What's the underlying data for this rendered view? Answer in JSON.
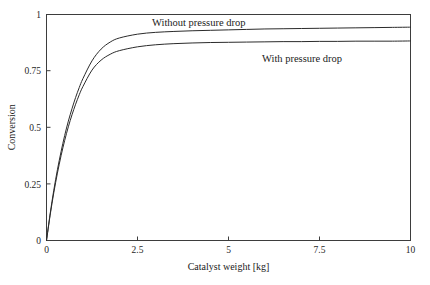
{
  "chart_data": {
    "type": "line",
    "title": "",
    "xlabel": "Catalyst weight [kg]",
    "ylabel": "Conversion",
    "xlim": [
      0,
      10
    ],
    "ylim": [
      0,
      1
    ],
    "xticks": [
      0,
      2.5,
      5,
      7.5,
      10
    ],
    "xtick_labels": [
      "0",
      "2.5",
      "5",
      "7.5",
      "10"
    ],
    "yticks": [
      0,
      0.25,
      0.5,
      0.75,
      1
    ],
    "ytick_labels": [
      "0",
      "0.25",
      "0.5",
      "0.75",
      "1"
    ],
    "grid": false,
    "legend": "inline-annotations",
    "x": [
      0,
      0.1,
      0.2,
      0.3,
      0.4,
      0.5,
      0.6,
      0.7,
      0.8,
      0.9,
      1.0,
      1.25,
      1.5,
      1.75,
      2.0,
      2.5,
      3.0,
      3.5,
      4.0,
      4.5,
      5.0,
      5.5,
      6.0,
      6.5,
      7.0,
      7.5,
      8.0,
      8.5,
      9.0,
      9.5,
      10.0
    ],
    "series": [
      {
        "name": "Without pressure drop",
        "values": [
          0,
          0.118,
          0.222,
          0.313,
          0.393,
          0.465,
          0.528,
          0.583,
          0.633,
          0.677,
          0.716,
          0.795,
          0.847,
          0.878,
          0.896,
          0.913,
          0.921,
          0.925,
          0.928,
          0.93,
          0.932,
          0.934,
          0.936,
          0.937,
          0.938,
          0.939,
          0.94,
          0.941,
          0.942,
          0.943,
          0.944
        ],
        "annotation": "Without pressure drop",
        "annotation_x": 3.6,
        "annotation_y": 0.945
      },
      {
        "name": "With pressure drop",
        "values": [
          0,
          0.112,
          0.211,
          0.298,
          0.375,
          0.443,
          0.503,
          0.556,
          0.603,
          0.645,
          0.681,
          0.754,
          0.798,
          0.824,
          0.84,
          0.857,
          0.866,
          0.871,
          0.874,
          0.876,
          0.877,
          0.878,
          0.879,
          0.88,
          0.88,
          0.881,
          0.881,
          0.882,
          0.882,
          0.882,
          0.883
        ],
        "annotation": "With pressure drop",
        "annotation_x": 6.8,
        "annotation_y": 0.81
      }
    ]
  },
  "axes": {
    "x_title": "Catalyst weight [kg]",
    "y_title": "Conversion"
  },
  "colors": {
    "line": "#2b2b2b",
    "frame": "#3d3d3d",
    "background": "#ffffff",
    "text": "#1a1a1a"
  }
}
